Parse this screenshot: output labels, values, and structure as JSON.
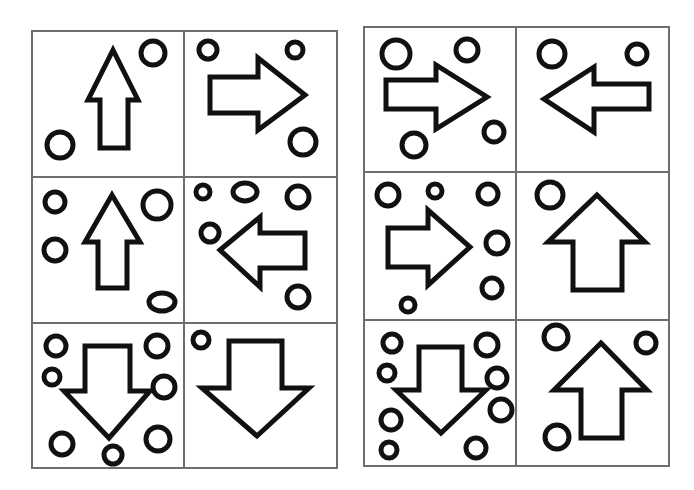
{
  "puzzle": {
    "description": "Two 2x3 grids of panels, each containing one outlined arrow and several small circles",
    "colors": {
      "line": "#111111",
      "grid": "#6e6e6e",
      "background": "#ffffff"
    },
    "grids": [
      {
        "name": "left-grid",
        "frame": {
          "x": 32,
          "y": 31,
          "w": 305,
          "h": 437
        },
        "dividers": {
          "v": [
            184
          ],
          "h": [
            177,
            323
          ]
        },
        "cells": [
          {
            "id": "L1",
            "arrow": "up",
            "arrow_points": "113,50 138,100 128,100 128,148 100,148 100,100 88,100",
            "circles": [
              [
                153,
                53,
                12,
                12
              ],
              [
                60,
                145,
                13,
                13
              ]
            ]
          },
          {
            "id": "L2",
            "arrow": "right",
            "arrow_points": "210,77 258,77 258,58 305,95 258,130 258,113 210,113",
            "circles": [
              [
                208,
                50,
                9,
                9
              ],
              [
                295,
                50,
                8,
                8
              ],
              [
                303,
                142,
                13,
                13
              ]
            ]
          },
          {
            "id": "L3",
            "arrow": "up",
            "arrow_points": "112,195 140,242 127,242 127,288 98,288 98,242 85,242",
            "circles": [
              [
                55,
                202,
                10,
                10
              ],
              [
                157,
                205,
                14,
                14
              ],
              [
                55,
                250,
                11,
                11
              ],
              [
                162,
                302,
                13,
                9
              ]
            ]
          },
          {
            "id": "L4",
            "arrow": "left",
            "arrow_points": "220,250 260,217 260,233 305,233 305,268 260,268 260,287",
            "circles": [
              [
                203,
                192,
                7,
                7
              ],
              [
                245,
                192,
                12,
                9
              ],
              [
                298,
                197,
                11,
                11
              ],
              [
                210,
                233,
                9,
                9
              ],
              [
                298,
                297,
                11,
                11
              ]
            ]
          },
          {
            "id": "L5",
            "arrow": "down",
            "arrow_points": "85,346 130,346 130,391 150,391 109,438 64,391 85,391",
            "circles": [
              [
                56,
                346,
                10,
                10
              ],
              [
                157,
                346,
                11,
                11
              ],
              [
                52,
                377,
                8,
                8
              ],
              [
                164,
                387,
                11,
                11
              ],
              [
                62,
                444,
                11,
                11
              ],
              [
                158,
                439,
                12,
                12
              ],
              [
                113,
                455,
                9,
                9
              ]
            ]
          },
          {
            "id": "L6",
            "arrow": "down",
            "arrow_points": "229,341 282,341 282,388 309,388 257,436 202,388 229,388",
            "circles": [
              [
                201,
                340,
                8,
                8
              ]
            ]
          }
        ]
      },
      {
        "name": "right-grid",
        "frame": {
          "x": 364,
          "y": 27,
          "w": 305,
          "h": 439
        },
        "dividers": {
          "v": [
            516
          ],
          "h": [
            172,
            320
          ]
        },
        "cells": [
          {
            "id": "R1",
            "arrow": "right",
            "arrow_points": "386,80 436,80 436,65 487,97 436,129 436,109 386,109",
            "circles": [
              [
                396,
                54,
                14,
                14
              ],
              [
                467,
                50,
                11,
                11
              ],
              [
                494,
                132,
                10,
                10
              ],
              [
                414,
                145,
                12,
                12
              ]
            ]
          },
          {
            "id": "R2",
            "arrow": "left",
            "arrow_points": "544,99 594,67 594,84 649,84 649,109 594,109 594,132",
            "circles": [
              [
                552,
                54,
                13,
                13
              ],
              [
                637,
                54,
                10,
                10
              ]
            ]
          },
          {
            "id": "R3",
            "arrow": "right",
            "arrow_points": "388,228 428,228 428,210 470,247 428,285 428,267 388,267",
            "circles": [
              [
                388,
                195,
                11,
                11
              ],
              [
                435,
                191,
                7,
                7
              ],
              [
                488,
                194,
                10,
                10
              ],
              [
                497,
                243,
                11,
                11
              ],
              [
                492,
                288,
                10,
                10
              ],
              [
                408,
                305,
                7,
                7
              ]
            ]
          },
          {
            "id": "R4",
            "arrow": "up",
            "arrow_points": "597,195 645,242 622,242 622,290 573,290 573,242 548,242",
            "circles": [
              [
                550,
                195,
                13,
                13
              ]
            ]
          },
          {
            "id": "R5",
            "arrow": "down",
            "arrow_points": "419,347 462,347 462,390 486,390 441,433 396,390 419,390",
            "circles": [
              [
                392,
                343,
                9,
                9
              ],
              [
                487,
                345,
                11,
                11
              ],
              [
                387,
                373,
                8,
                8
              ],
              [
                497,
                378,
                10,
                10
              ],
              [
                391,
                420,
                10,
                10
              ],
              [
                501,
                410,
                11,
                11
              ],
              [
                389,
                450,
                8,
                8
              ],
              [
                476,
                448,
                10,
                10
              ]
            ]
          },
          {
            "id": "R6",
            "arrow": "up",
            "arrow_points": "601,343 647,390 622,390 622,438 581,438 581,390 554,390",
            "circles": [
              [
                556,
                337,
                12,
                12
              ],
              [
                646,
                343,
                10,
                10
              ],
              [
                557,
                437,
                12,
                12
              ]
            ]
          }
        ]
      }
    ]
  }
}
